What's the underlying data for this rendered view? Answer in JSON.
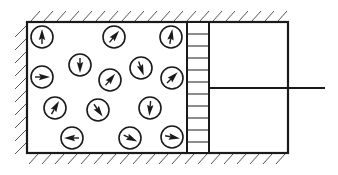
{
  "diagram": {
    "title": "",
    "colors": {
      "stroke": "#1a1a1a",
      "background": "#ffffff",
      "hatch": "#555555"
    },
    "cylinder": {
      "x": 27,
      "y": 22,
      "width": 261,
      "height": 131
    },
    "piston": {
      "x": 187,
      "width": 22,
      "stripe_spacing": 12
    },
    "rod": {
      "y": 88,
      "x_end": 325
    },
    "molecules": [
      {
        "cx": 42,
        "cy": 37,
        "angle": 0
      },
      {
        "cx": 114,
        "cy": 37,
        "angle": 40
      },
      {
        "cx": 171,
        "cy": 37,
        "angle": 10
      },
      {
        "cx": 42,
        "cy": 77,
        "angle": 90
      },
      {
        "cx": 80,
        "cy": 65,
        "angle": 180
      },
      {
        "cx": 141,
        "cy": 68,
        "angle": 160
      },
      {
        "cx": 110,
        "cy": 80,
        "angle": 40
      },
      {
        "cx": 172,
        "cy": 78,
        "angle": 45
      },
      {
        "cx": 55,
        "cy": 108,
        "angle": 30
      },
      {
        "cx": 98,
        "cy": 110,
        "angle": 145
      },
      {
        "cx": 150,
        "cy": 108,
        "angle": 185
      },
      {
        "cx": 72,
        "cy": 138,
        "angle": 270
      },
      {
        "cx": 130,
        "cy": 138,
        "angle": 115
      },
      {
        "cx": 172,
        "cy": 137,
        "angle": 100
      }
    ]
  }
}
